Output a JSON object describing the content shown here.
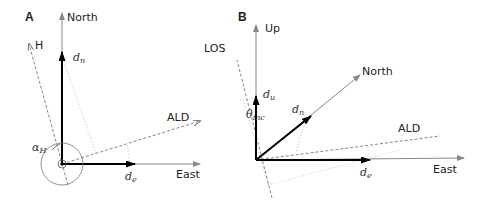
{
  "panels": [
    {
      "id": "A",
      "label": "A",
      "axes": {
        "north": "North",
        "east": "East"
      },
      "directions": {
        "heading": "H",
        "ald": "ALD"
      },
      "components": {
        "dn": "d",
        "dn_sub": "n",
        "de": "d",
        "de_sub": "e"
      },
      "angle": {
        "symbol": "α",
        "sub": "H"
      }
    },
    {
      "id": "B",
      "label": "B",
      "axes": {
        "up": "Up",
        "north": "North",
        "east": "East"
      },
      "directions": {
        "los": "LOS",
        "ald": "ALD"
      },
      "components": {
        "du": "d",
        "du_sub": "u",
        "dn": "d",
        "dn_sub": "n",
        "de": "d",
        "de_sub": "e"
      },
      "angle": {
        "symbol": "θ",
        "sub": "inc"
      }
    }
  ],
  "colors": {
    "axis": "#888888",
    "vector": "#000000",
    "dashed": "#777777",
    "dotted": "#aaaaaa",
    "text": "#222222"
  }
}
